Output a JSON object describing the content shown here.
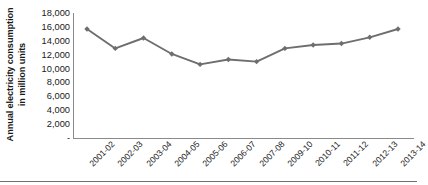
{
  "chart_data": {
    "type": "line",
    "title": "",
    "xlabel": "",
    "ylabel": "Annual electricity consumption in million units",
    "ylabel_lines": [
      "Annual electricity consumption",
      "in million units"
    ],
    "categories": [
      "2001-02",
      "2002-03",
      "2003-04",
      "2004-05",
      "2005-06",
      "2006-07",
      "2007-08",
      "2009-10",
      "2010-11",
      "2011-12",
      "2012-13",
      "2013-14"
    ],
    "values": [
      15700,
      12900,
      14400,
      12100,
      10600,
      11300,
      11000,
      12900,
      13400,
      13600,
      14500,
      15700
    ],
    "series": [
      {
        "name": "Annual electricity consumption",
        "values": [
          15700,
          12900,
          14400,
          12100,
          10600,
          11300,
          11000,
          12900,
          13400,
          13600,
          14500,
          15700
        ]
      }
    ],
    "ylim": [
      0,
      18000
    ],
    "ytick_values": [
      18000,
      16000,
      14000,
      12000,
      10000,
      8000,
      6000,
      4000,
      2000,
      0
    ],
    "ytick_labels": [
      "18,000",
      "16,000",
      "14,000",
      "12,000",
      "10,000",
      "8,000",
      "6,000",
      "4,000",
      "2,000",
      "-"
    ],
    "grid": false,
    "legend": "none",
    "marker": "diamond",
    "line_color": "#6e6e6e",
    "marker_color": "#6e6e6e",
    "axis_color": "#8a8a8a"
  }
}
